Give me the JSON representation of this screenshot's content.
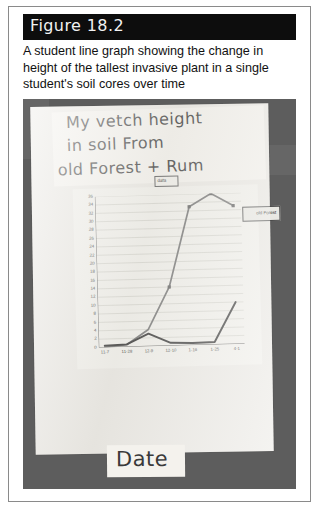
{
  "figure": {
    "banner_label": "Figure 18.2",
    "caption": "A student line graph showing the change in height of the tallest invasive plant in a single student's soil cores over time"
  },
  "photo": {
    "handwritten_title_line1": "My vetch height",
    "handwritten_title_line2": "in soil  From",
    "handwritten_title_line3": "old Forest + Rum",
    "handwritten_y_axis_label": "vetch height (cm",
    "handwritten_x_axis_label": "Date",
    "data_tag_label": "data",
    "legend_label": "Series"
  },
  "chart_data": {
    "type": "line",
    "title": "My vetch height in soil From old Forest + Rum",
    "xlabel": "Date",
    "ylabel": "vetch height (cm)",
    "ylim": [
      0,
      36
    ],
    "ytick_step": 2,
    "grid": true,
    "legend_position": "top-right",
    "categories": [
      "11-7",
      "11-28",
      "12-9",
      "12-10",
      "1-16",
      "1-25",
      "4-1"
    ],
    "yticks": [
      36,
      34,
      32,
      30,
      28,
      26,
      24,
      22,
      20,
      18,
      16,
      14,
      12,
      10,
      8,
      6,
      4,
      2,
      0
    ],
    "series": [
      {
        "name": "old Forest",
        "values": [
          0,
          0.5,
          4,
          14,
          33,
          36,
          33
        ]
      },
      {
        "name": "Rum",
        "values": [
          0.4,
          0.6,
          3,
          0.7,
          0.5,
          0.6,
          10
        ]
      }
    ]
  }
}
